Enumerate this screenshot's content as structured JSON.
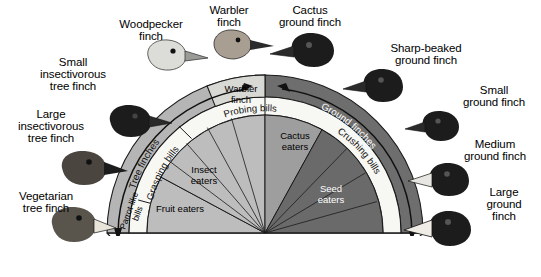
{
  "figure": {
    "type": "diagram",
    "background_color": "#ffffff"
  },
  "colors": {
    "tree_ring": "#b5b5b5",
    "ground_ring": "#6e6e6e",
    "tree_sector": "#bdbdbd",
    "cactus_sector": "#9e9e9e",
    "ground_sector": "#6a6a6a",
    "band_white": "#f7f7f4",
    "warbler_cell": "#d8d8d4",
    "outline": "#1a1a1a",
    "text_dark": "#000000",
    "text_light": "#ffffff"
  },
  "species_callouts": [
    {
      "name": "woodpecker-finch",
      "label": "Woodpecker\nfinch",
      "x": 108,
      "y": 18,
      "w": 86
    },
    {
      "name": "warbler-finch",
      "label": "Warbler\nfinch",
      "x": 196,
      "y": 4,
      "w": 66
    },
    {
      "name": "cactus-ground-finch",
      "label": "Cactus\nground finch",
      "x": 268,
      "y": 4,
      "w": 84
    },
    {
      "name": "sharp-beaked-ground-finch",
      "label": "Sharp-beaked\nground finch",
      "x": 378,
      "y": 42,
      "w": 96
    },
    {
      "name": "small-ground-finch",
      "label": "Small\nground finch",
      "x": 452,
      "y": 84,
      "w": 84
    },
    {
      "name": "medium-ground-finch",
      "label": "Medium\nground finch",
      "x": 452,
      "y": 138,
      "w": 86
    },
    {
      "name": "large-ground-finch",
      "label": "Large\nground\nfinch",
      "x": 470,
      "y": 186,
      "w": 68
    },
    {
      "name": "small-insectivorous-tree-finch",
      "label": "Small\ninsectivorous\ntree finch",
      "x": 24,
      "y": 56,
      "w": 98
    },
    {
      "name": "large-insectivorous-tree-finch",
      "label": "Large\ninsectivorous\ntree finch",
      "x": 2,
      "y": 108,
      "w": 98
    },
    {
      "name": "vegetarian-tree-finch",
      "label": "Vegetarian\ntree finch",
      "x": 4,
      "y": 190,
      "w": 84
    }
  ],
  "diagram": {
    "center": {
      "x": 265,
      "y": 233
    },
    "outer_ring": {
      "tree_label": "Tree finches",
      "ground_label": "Ground finches",
      "radius_outer": 158,
      "radius_inner": 136
    },
    "bill_band": {
      "segments": [
        {
          "name": "parrot-like-bills",
          "label": "Parrot-like\nbills"
        },
        {
          "name": "grasping-bills",
          "label": "Grasping bills"
        },
        {
          "name": "probing-bills",
          "label": "Probing bills"
        },
        {
          "name": "crushing-bills",
          "label": "Crushing bills"
        }
      ]
    },
    "warbler_cell": {
      "name": "warbler-finch-cell",
      "label": "Warbler\nfinch"
    },
    "diet_sectors": [
      {
        "name": "fruit-eaters",
        "label": "Fruit eaters",
        "group": "tree",
        "fill": "#bdbdbd",
        "text": "#000000"
      },
      {
        "name": "insect-eaters",
        "label": "Insect\neaters",
        "group": "tree",
        "fill": "#bdbdbd",
        "text": "#000000"
      },
      {
        "name": "cactus-eaters",
        "label": "Cactus\neaters",
        "group": "ground",
        "fill": "#9e9e9e",
        "text": "#000000"
      },
      {
        "name": "seed-eaters",
        "label": "Seed\neaters",
        "group": "ground",
        "fill": "#6a6a6a",
        "text": "#ffffff"
      }
    ],
    "arrows": [
      {
        "name": "tree-finches-arrow",
        "direction": "counterclockwise-down-left"
      },
      {
        "name": "ground-finches-arrow",
        "direction": "clockwise-down-right"
      }
    ]
  }
}
